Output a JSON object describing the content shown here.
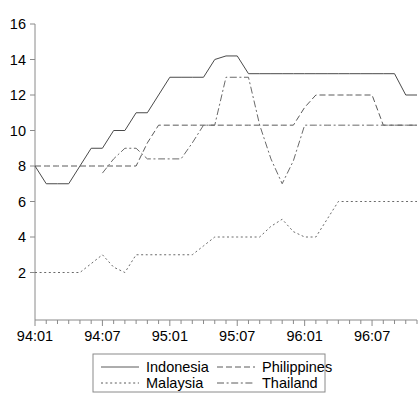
{
  "chart_data": {
    "type": "line",
    "title": "",
    "xlabel": "",
    "ylabel": "",
    "ylim": [
      0,
      16
    ],
    "yticks": [
      2,
      4,
      6,
      8,
      10,
      12,
      14,
      16
    ],
    "xtick_labels": [
      "94:01",
      "94:07",
      "95:01",
      "95:07",
      "96:01",
      "96:07"
    ],
    "xtick_indices": [
      0,
      6,
      12,
      18,
      24,
      30
    ],
    "x_minor_ticks_per_label": 6,
    "grid": false,
    "legend_position": "below",
    "x": [
      "94:01",
      "94:02",
      "94:03",
      "94:04",
      "94:05",
      "94:06",
      "94:07",
      "94:08",
      "94:09",
      "94:10",
      "94:11",
      "94:12",
      "95:01",
      "95:02",
      "95:03",
      "95:04",
      "95:05",
      "95:06",
      "95:07",
      "95:08",
      "95:09",
      "95:10",
      "95:11",
      "95:12",
      "96:01",
      "96:02",
      "96:03",
      "96:04",
      "96:05",
      "96:06",
      "96:07",
      "96:08",
      "96:09",
      "96:10",
      "96:11"
    ],
    "series": [
      {
        "name": "Indonesia",
        "style": "solid",
        "color": "#4a4a4a",
        "values": [
          8,
          7,
          7,
          7,
          8,
          9,
          9,
          10,
          10,
          11,
          11,
          12,
          13,
          13,
          13,
          13,
          14,
          14.2,
          14.2,
          13.2,
          13.2,
          13.2,
          13.2,
          13.2,
          13.2,
          13.2,
          13.2,
          13.2,
          13.2,
          13.2,
          13.2,
          13.2,
          13.2,
          12,
          12
        ]
      },
      {
        "name": "Philippines",
        "style": "dashed",
        "color": "#5a5a5a",
        "values": [
          8,
          8,
          8,
          8,
          8,
          8,
          8,
          8,
          8,
          8,
          9.3,
          10.3,
          10.3,
          10.3,
          10.3,
          10.3,
          10.3,
          10.3,
          10.3,
          10.3,
          10.3,
          10.3,
          10.3,
          10.3,
          11.3,
          12,
          12,
          12,
          12,
          12,
          12,
          10.3,
          10.3,
          10.3,
          10.3
        ]
      },
      {
        "name": "Malaysia",
        "style": "dotted",
        "color": "#6a6a6a",
        "values": [
          2,
          2,
          2,
          2,
          2,
          2.5,
          3,
          2.3,
          2,
          3,
          3,
          3,
          3,
          3,
          3,
          3.5,
          4,
          4,
          4,
          4,
          4,
          4.6,
          5,
          4.3,
          4,
          4,
          5,
          6,
          6,
          6,
          6,
          6,
          6,
          6,
          6
        ]
      },
      {
        "name": "Thailand",
        "style": "dashdot",
        "color": "#6a6a6a",
        "values": [
          null,
          null,
          null,
          null,
          null,
          null,
          7.6,
          8.4,
          9,
          9,
          8.4,
          8.4,
          8.4,
          8.4,
          9.3,
          10.3,
          10.3,
          13,
          13,
          13,
          10.3,
          8.4,
          7,
          8.3,
          10.3,
          10.3,
          10.3,
          10.3,
          10.3,
          10.3,
          10.3,
          10.3,
          10.3,
          10.3,
          10.3
        ]
      }
    ],
    "legend": [
      {
        "name": "Indonesia",
        "style": "solid"
      },
      {
        "name": "Philippines",
        "style": "dashed"
      },
      {
        "name": "Malaysia",
        "style": "dotted"
      },
      {
        "name": "Thailand",
        "style": "dashdot"
      }
    ]
  },
  "caption": ""
}
